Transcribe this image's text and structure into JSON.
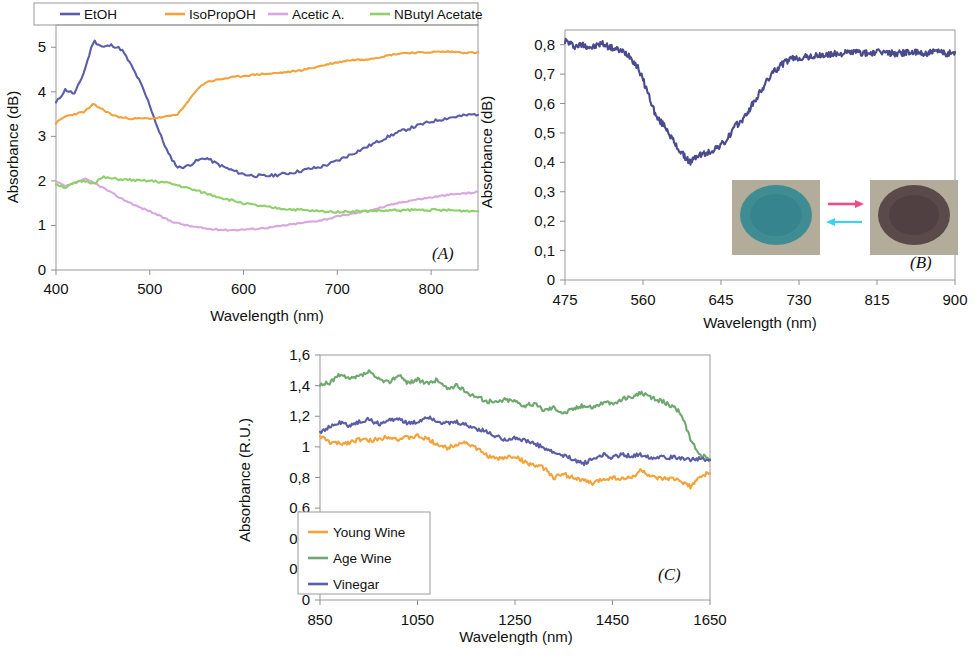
{
  "figure": {
    "panels": [
      "(A)",
      "(B)",
      "(C)"
    ]
  },
  "panelA": {
    "label": "(A)",
    "xlabel": "Wavelength (nm)",
    "ylabel": "Absorbance (dB)",
    "legend": [
      {
        "name": "EtOH",
        "color": "#5b5ea6"
      },
      {
        "name": "IsoPropOH",
        "color": "#f2a33c"
      },
      {
        "name": "Acetic A.",
        "color": "#d9a6e0"
      },
      {
        "name": "NButyl Acetate",
        "color": "#8ed06a"
      }
    ],
    "xticks": [
      "400",
      "500",
      "600",
      "700",
      "800"
    ],
    "yticks": [
      "0",
      "1",
      "2",
      "3",
      "4",
      "5"
    ]
  },
  "panelB": {
    "label": "(B)",
    "xlabel": "Wavelength (nm)",
    "ylabel": "Absorbance (dB)",
    "xticks": [
      "475",
      "560",
      "645",
      "730",
      "815",
      "900"
    ],
    "yticks": [
      "0",
      "0,1",
      "0,2",
      "0,3",
      "0,4",
      "0,5",
      "0,6",
      "0,7",
      "0,8"
    ],
    "inset": {
      "left_sample_color": "#3f8d93",
      "right_sample_color": "#5a4a4a",
      "background_color": "#b3ac9a",
      "forward_arrow_color": "#ef4a8b",
      "reverse_arrow_color": "#3fd0ef"
    },
    "series_color": "#4a4a8c"
  },
  "panelC": {
    "label": "(C)",
    "xlabel": "Wavelength (nm)",
    "ylabel": "Absorbance (R.U.)",
    "legend": [
      {
        "name": "Young Wine",
        "color": "#f2a33c"
      },
      {
        "name": "Age Wine",
        "color": "#6fa86f"
      },
      {
        "name": "Vinegar",
        "color": "#5b5ea6"
      }
    ],
    "xticks": [
      "850",
      "1050",
      "1250",
      "1450",
      "1650"
    ],
    "yticks": [
      "0",
      "0,2",
      "0,4",
      "0,6",
      "0,8",
      "1",
      "1,2",
      "1,4",
      "1,6"
    ]
  },
  "chart_data": [
    {
      "type": "line",
      "panel": "(A)",
      "title": "",
      "xlabel": "Wavelength (nm)",
      "ylabel": "Absorbance (dB)",
      "xlim": [
        400,
        850
      ],
      "ylim": [
        0,
        5.5
      ],
      "xticks": [
        400,
        500,
        600,
        700,
        800
      ],
      "yticks": [
        0,
        1,
        2,
        3,
        4,
        5
      ],
      "grid": false,
      "legend_position": "top",
      "x": [
        400,
        410,
        420,
        430,
        440,
        450,
        460,
        470,
        480,
        490,
        500,
        510,
        520,
        530,
        540,
        550,
        560,
        570,
        580,
        590,
        600,
        610,
        620,
        630,
        640,
        650,
        660,
        670,
        680,
        690,
        700,
        710,
        720,
        730,
        740,
        750,
        760,
        770,
        780,
        790,
        800,
        810,
        820,
        830,
        840,
        850
      ],
      "series": [
        {
          "name": "EtOH",
          "color": "#5b5ea6",
          "values": [
            3.75,
            4.05,
            3.95,
            4.45,
            5.15,
            5.0,
            5.05,
            4.95,
            4.6,
            4.2,
            3.7,
            3.1,
            2.6,
            2.3,
            2.33,
            2.45,
            2.52,
            2.4,
            2.3,
            2.22,
            2.15,
            2.12,
            2.11,
            2.12,
            2.15,
            2.18,
            2.22,
            2.27,
            2.3,
            2.37,
            2.45,
            2.55,
            2.65,
            2.75,
            2.85,
            2.95,
            3.05,
            3.13,
            3.2,
            3.27,
            3.33,
            3.38,
            3.42,
            3.45,
            3.48,
            3.5
          ]
        },
        {
          "name": "IsoPropOH",
          "color": "#f2a33c",
          "values": [
            3.3,
            3.45,
            3.5,
            3.55,
            3.72,
            3.6,
            3.48,
            3.42,
            3.4,
            3.4,
            3.4,
            3.42,
            3.45,
            3.5,
            3.75,
            4.05,
            4.22,
            4.26,
            4.3,
            4.33,
            4.36,
            4.38,
            4.4,
            4.41,
            4.43,
            4.45,
            4.48,
            4.52,
            4.57,
            4.62,
            4.66,
            4.7,
            4.72,
            4.73,
            4.76,
            4.8,
            4.84,
            4.87,
            4.88,
            4.88,
            4.89,
            4.9,
            4.9,
            4.89,
            4.88,
            4.88
          ]
        },
        {
          "name": "Acetic A.",
          "color": "#d9a6e0",
          "values": [
            1.98,
            1.88,
            1.95,
            2.05,
            1.96,
            1.85,
            1.72,
            1.6,
            1.5,
            1.4,
            1.32,
            1.22,
            1.12,
            1.05,
            1.0,
            0.96,
            0.93,
            0.91,
            0.9,
            0.9,
            0.91,
            0.92,
            0.94,
            0.96,
            0.99,
            1.02,
            1.05,
            1.08,
            1.11,
            1.15,
            1.2,
            1.24,
            1.28,
            1.32,
            1.37,
            1.42,
            1.48,
            1.53,
            1.57,
            1.6,
            1.63,
            1.66,
            1.69,
            1.71,
            1.73,
            1.75
          ]
        },
        {
          "name": "NButyl Acetate",
          "color": "#8ed06a",
          "values": [
            1.93,
            1.85,
            1.95,
            2.0,
            1.95,
            2.08,
            2.05,
            2.03,
            2.02,
            2.0,
            2.0,
            1.98,
            1.95,
            1.9,
            1.84,
            1.78,
            1.72,
            1.66,
            1.6,
            1.55,
            1.5,
            1.46,
            1.43,
            1.4,
            1.38,
            1.36,
            1.35,
            1.33,
            1.32,
            1.31,
            1.31,
            1.31,
            1.32,
            1.32,
            1.33,
            1.33,
            1.34,
            1.34,
            1.35,
            1.35,
            1.35,
            1.34,
            1.34,
            1.33,
            1.33,
            1.32
          ]
        }
      ]
    },
    {
      "type": "line",
      "panel": "(B)",
      "title": "",
      "xlabel": "Wavelength (nm)",
      "ylabel": "Absorbance (dB)",
      "xlim": [
        475,
        900
      ],
      "ylim": [
        0,
        0.85
      ],
      "xticks": [
        475,
        560,
        645,
        730,
        815,
        900
      ],
      "yticks": [
        0,
        0.1,
        0.2,
        0.3,
        0.4,
        0.5,
        0.6,
        0.7,
        0.8
      ],
      "grid": false,
      "legend_position": "none",
      "series": [
        {
          "name": "Absorbance",
          "color": "#4a4a8c",
          "x": [
            475,
            485,
            495,
            505,
            515,
            525,
            535,
            545,
            555,
            565,
            575,
            585,
            595,
            605,
            612,
            620,
            630,
            640,
            650,
            660,
            670,
            680,
            690,
            700,
            710,
            720,
            730,
            745,
            760,
            775,
            790,
            805,
            820,
            835,
            850,
            865,
            880,
            895,
            900
          ],
          "values": [
            0.815,
            0.795,
            0.8,
            0.79,
            0.805,
            0.79,
            0.78,
            0.765,
            0.72,
            0.64,
            0.55,
            0.52,
            0.46,
            0.42,
            0.4,
            0.425,
            0.43,
            0.45,
            0.47,
            0.52,
            0.55,
            0.6,
            0.65,
            0.7,
            0.73,
            0.75,
            0.755,
            0.76,
            0.765,
            0.77,
            0.775,
            0.77,
            0.775,
            0.77,
            0.775,
            0.77,
            0.775,
            0.77,
            0.775
          ]
        }
      ]
    },
    {
      "type": "line",
      "panel": "(C)",
      "title": "",
      "xlabel": "Wavelength (nm)",
      "ylabel": "Absorbance (R.U.)",
      "xlim": [
        850,
        1650
      ],
      "ylim": [
        0,
        1.6
      ],
      "xticks": [
        850,
        1050,
        1250,
        1450,
        1650
      ],
      "yticks": [
        0,
        0.2,
        0.4,
        0.6,
        0.8,
        1.0,
        1.2,
        1.4,
        1.6
      ],
      "grid": false,
      "legend_position": "bottom-left",
      "x": [
        850,
        870,
        890,
        910,
        930,
        950,
        970,
        990,
        1010,
        1030,
        1050,
        1070,
        1090,
        1110,
        1130,
        1150,
        1170,
        1190,
        1210,
        1230,
        1250,
        1270,
        1290,
        1310,
        1330,
        1350,
        1370,
        1390,
        1410,
        1430,
        1450,
        1470,
        1490,
        1510,
        1530,
        1550,
        1570,
        1590,
        1610,
        1630,
        1645,
        1650
      ],
      "series": [
        {
          "name": "Young Wine",
          "color": "#f2a33c",
          "values": [
            1.07,
            1.03,
            1.02,
            1.03,
            1.05,
            1.04,
            1.05,
            1.07,
            1.05,
            1.06,
            1.07,
            1.05,
            1.02,
            0.99,
            1.02,
            1.03,
            0.99,
            0.95,
            0.92,
            0.93,
            0.94,
            0.9,
            0.88,
            0.86,
            0.8,
            0.82,
            0.8,
            0.78,
            0.76,
            0.79,
            0.8,
            0.79,
            0.8,
            0.85,
            0.8,
            0.79,
            0.79,
            0.78,
            0.74,
            0.8,
            0.83,
            0.82
          ]
        },
        {
          "name": "Age Wine",
          "color": "#6fa86f",
          "values": [
            1.4,
            1.42,
            1.47,
            1.44,
            1.46,
            1.49,
            1.44,
            1.42,
            1.47,
            1.42,
            1.44,
            1.41,
            1.44,
            1.38,
            1.4,
            1.36,
            1.33,
            1.3,
            1.29,
            1.31,
            1.3,
            1.27,
            1.28,
            1.24,
            1.26,
            1.22,
            1.25,
            1.27,
            1.26,
            1.29,
            1.28,
            1.31,
            1.33,
            1.35,
            1.32,
            1.3,
            1.27,
            1.22,
            1.05,
            0.95,
            0.92,
            0.92
          ]
        },
        {
          "name": "Vinegar",
          "color": "#5b5ea6",
          "values": [
            1.1,
            1.13,
            1.16,
            1.14,
            1.16,
            1.18,
            1.15,
            1.17,
            1.19,
            1.15,
            1.16,
            1.2,
            1.17,
            1.15,
            1.16,
            1.14,
            1.12,
            1.1,
            1.07,
            1.05,
            1.06,
            1.04,
            1.02,
            0.99,
            0.96,
            0.94,
            0.92,
            0.89,
            0.92,
            0.95,
            0.93,
            0.95,
            0.94,
            0.95,
            0.93,
            0.94,
            0.93,
            0.93,
            0.92,
            0.92,
            0.91,
            0.92
          ]
        }
      ]
    }
  ]
}
